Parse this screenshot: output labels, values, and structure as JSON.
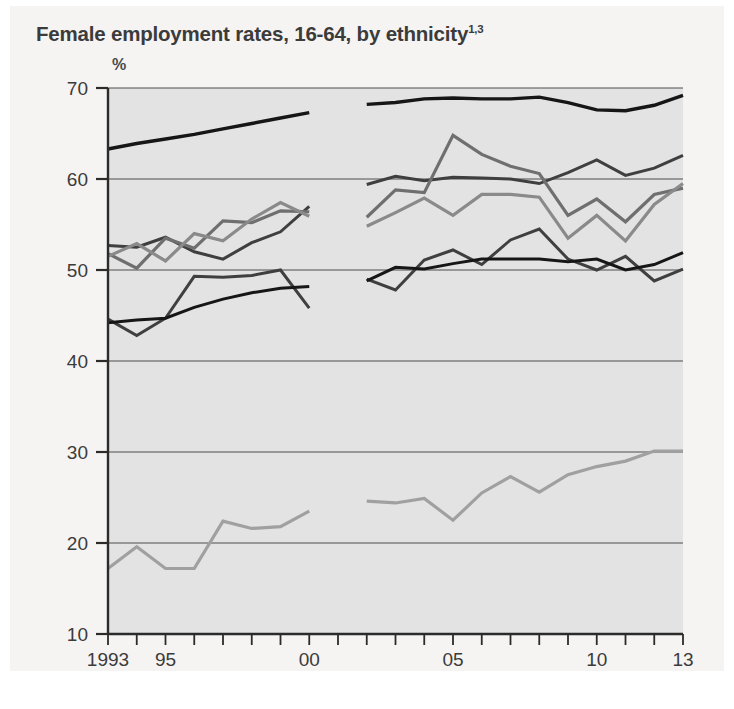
{
  "title": {
    "text": "Female employment rates, 16-64, by ethnicity",
    "superscript": "1,3"
  },
  "axis_unit": "%",
  "colors": {
    "plot_background": "#e3e3e3",
    "page_background": "#f6f4f2",
    "gridline": "#4f4f4f",
    "axis": "#2b2b2b",
    "series_black": "#161616",
    "series_dark_gray": "#3f3f3f",
    "series_mid_gray": "#6f6f6f",
    "series_gray": "#8a8a8a",
    "series_light_gray": "#a0a0a0"
  },
  "chart_data": {
    "type": "line",
    "title": "Female employment rates, 16-64, by ethnicity",
    "xlabel": "",
    "ylabel": "%",
    "xlim": [
      1993,
      2013
    ],
    "ylim": [
      10,
      70
    ],
    "yticks": [
      10,
      20,
      30,
      40,
      50,
      60,
      70
    ],
    "xticks": [
      1993,
      1994,
      1995,
      1996,
      1997,
      1998,
      1999,
      2000,
      2001,
      2002,
      2003,
      2004,
      2005,
      2006,
      2007,
      2008,
      2009,
      2010,
      2011,
      2012,
      2013
    ],
    "xtick_labels": [
      {
        "x": 1993,
        "label": "1993"
      },
      {
        "x": 1995,
        "label": "95"
      },
      {
        "x": 2000,
        "label": "00"
      },
      {
        "x": 2005,
        "label": "05"
      },
      {
        "x": 2010,
        "label": "10"
      },
      {
        "x": 2013,
        "label": "13"
      }
    ],
    "grid": true,
    "legend": "none",
    "note": "Series are split into two eras: 1993-2000 and 2002-2013, with a break in the data between 2000 and 2002.",
    "series": [
      {
        "name": "White",
        "color": "#161616",
        "width": 3.4,
        "segments": [
          {
            "x": [
              1993,
              1994,
              1995,
              1996,
              1997,
              1998,
              1999,
              2000
            ],
            "y": [
              63.3,
              63.9,
              64.4,
              64.9,
              65.5,
              66.1,
              66.7,
              67.3
            ]
          },
          {
            "x": [
              2002,
              2003,
              2004,
              2005,
              2006,
              2007,
              2008,
              2009,
              2010,
              2011,
              2012,
              2013
            ],
            "y": [
              68.2,
              68.4,
              68.8,
              68.9,
              68.8,
              68.8,
              69.0,
              68.4,
              67.6,
              67.5,
              68.1,
              69.2
            ]
          }
        ]
      },
      {
        "name": "Indian",
        "color": "#3f3f3f",
        "width": 3.0,
        "segments": [
          {
            "x": [
              1993,
              1994,
              1995,
              1996,
              1997,
              1998,
              1999,
              2000
            ],
            "y": [
              52.7,
              52.5,
              53.6,
              52.0,
              51.2,
              53.0,
              54.2,
              57.0
            ]
          },
          {
            "x": [
              2002,
              2003,
              2004,
              2005,
              2006,
              2007,
              2008,
              2009,
              2010,
              2011,
              2012,
              2013
            ],
            "y": [
              59.4,
              60.3,
              59.8,
              60.2,
              60.1,
              60.0,
              59.5,
              60.7,
              62.1,
              60.4,
              61.2,
              62.6
            ]
          }
        ]
      },
      {
        "name": "Black Caribbean",
        "color": "#6f6f6f",
        "width": 3.2,
        "segments": [
          {
            "x": [
              1993,
              1994,
              1995,
              1996,
              1997,
              1998,
              1999,
              2000
            ],
            "y": [
              51.8,
              50.2,
              53.5,
              52.4,
              55.4,
              55.2,
              56.5,
              56.4
            ]
          },
          {
            "x": [
              2002,
              2003,
              2004,
              2005,
              2006,
              2007,
              2008,
              2009,
              2010,
              2011,
              2012,
              2013
            ],
            "y": [
              55.8,
              58.8,
              58.5,
              64.8,
              62.7,
              61.4,
              60.6,
              56.0,
              57.8,
              55.3,
              58.3,
              59.0
            ]
          }
        ]
      },
      {
        "name": "Black African",
        "color": "#8a8a8a",
        "width": 3.2,
        "segments": [
          {
            "x": [
              1993,
              1994,
              1995,
              1996,
              1997,
              1998,
              1999,
              2000
            ],
            "y": [
              51.5,
              52.9,
              51.0,
              54.0,
              53.2,
              55.6,
              57.4,
              55.9
            ]
          },
          {
            "x": [
              2002,
              2003,
              2004,
              2005,
              2006,
              2007,
              2008,
              2009,
              2010,
              2011,
              2012,
              2013
            ],
            "y": [
              54.8,
              56.3,
              57.9,
              56.0,
              58.3,
              58.3,
              58.0,
              53.5,
              56.0,
              53.2,
              57.2,
              59.5
            ]
          }
        ]
      },
      {
        "name": "Mixed / Other",
        "color": "#3f3f3f",
        "width": 3.0,
        "segments": [
          {
            "x": [
              1993,
              1994,
              1995,
              1996,
              1997,
              1998,
              1999,
              2000
            ],
            "y": [
              44.6,
              42.8,
              44.7,
              49.3,
              49.2,
              49.4,
              50.0,
              45.8
            ]
          },
          {
            "x": [
              2002,
              2003,
              2004,
              2005,
              2006,
              2007,
              2008,
              2009,
              2010,
              2011,
              2012,
              2013
            ],
            "y": [
              49.0,
              47.8,
              51.1,
              52.2,
              50.6,
              53.3,
              54.5,
              51.2,
              50.0,
              51.5,
              48.8,
              50.1
            ]
          }
        ]
      },
      {
        "name": "Chinese",
        "color": "#161616",
        "width": 3.0,
        "segments": [
          {
            "x": [
              1993,
              1994,
              1995,
              1996,
              1997,
              1998,
              1999,
              2000
            ],
            "y": [
              44.2,
              44.5,
              44.7,
              45.9,
              46.8,
              47.5,
              48.0,
              48.2
            ]
          },
          {
            "x": [
              2002,
              2003,
              2004,
              2005,
              2006,
              2007,
              2008,
              2009,
              2010,
              2011,
              2012,
              2013
            ],
            "y": [
              48.8,
              50.3,
              50.1,
              50.7,
              51.2,
              51.2,
              51.2,
              50.9,
              51.2,
              50.0,
              50.6,
              51.9
            ]
          }
        ]
      },
      {
        "name": "Pakistani / Bangladeshi",
        "color": "#a0a0a0",
        "width": 3.2,
        "segments": [
          {
            "x": [
              1993,
              1994,
              1995,
              1996,
              1997,
              1998,
              1999,
              2000
            ],
            "y": [
              17.2,
              19.6,
              17.2,
              17.2,
              22.4,
              21.6,
              21.8,
              23.5
            ]
          },
          {
            "x": [
              2002,
              2003,
              2004,
              2005,
              2006,
              2007,
              2008,
              2009,
              2010,
              2011,
              2012,
              2013
            ],
            "y": [
              24.6,
              24.4,
              24.9,
              22.5,
              25.5,
              27.3,
              25.6,
              27.5,
              28.4,
              29.0,
              30.1,
              30.1
            ]
          }
        ]
      }
    ]
  }
}
